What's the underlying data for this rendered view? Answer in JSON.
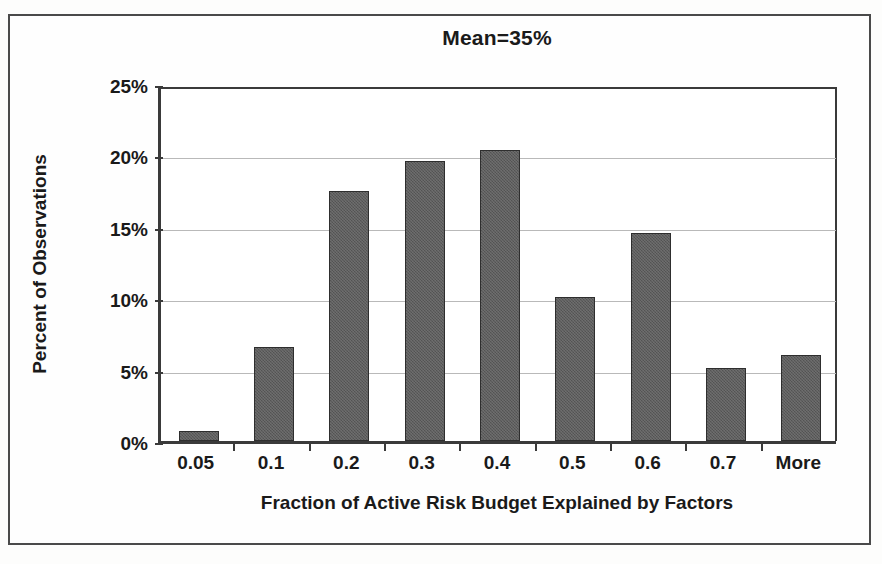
{
  "chart_data": {
    "type": "bar",
    "title": "Mean=35%",
    "xlabel": "Fraction of Active Risk Budget Explained by Factors",
    "ylabel": "Percent of Observations",
    "categories": [
      "0.05",
      "0.1",
      "0.2",
      "0.3",
      "0.4",
      "0.5",
      "0.6",
      "0.7",
      "More"
    ],
    "values": [
      0.7,
      6.6,
      17.5,
      19.6,
      20.4,
      10.1,
      14.6,
      5.1,
      6.0
    ],
    "ylim": [
      0,
      25
    ],
    "ytick_labels": [
      "0%",
      "5%",
      "10%",
      "15%",
      "20%",
      "25%"
    ],
    "ytick_values": [
      0,
      5,
      10,
      15,
      20,
      25
    ],
    "grid": "horizontal",
    "legend": "none",
    "bar_color": "#5c5c5c",
    "bar_edge_color": "#2e2e2e",
    "axis_color": "#3a3a3a",
    "gridline_color": "#b9b9b9",
    "frame_color": "#4a4a4a",
    "background_color": "#ffffff"
  }
}
